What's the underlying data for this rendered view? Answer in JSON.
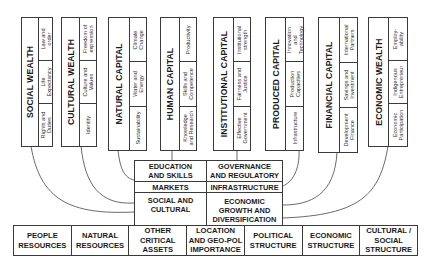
{
  "diagram": {
    "type": "capital-wealth-framework",
    "cards": [
      {
        "id": "social-wealth",
        "title": "SOCIAL WEALTH",
        "items": [
          "Rights and\nDuties",
          "Life\nExpectancy",
          "Law and\norder"
        ]
      },
      {
        "id": "cultural-wealth",
        "title": "CULTURAL WEALTH",
        "items": [
          "Identity",
          "Culture and\nValues",
          "Freedom of\nexpression"
        ]
      },
      {
        "id": "natural-capital",
        "title": "NATURAL CAPITAL",
        "items": [
          "Sustainability",
          "Water and\nEnergy",
          "Climate\nChange"
        ]
      },
      {
        "id": "human-capital",
        "title": "HUMAN CAPITAL",
        "items": [
          "Knowledge\nand Research",
          "Skills and\nCompetence",
          "Productivity"
        ]
      },
      {
        "id": "institutional-capital",
        "title": "INSTITUTIONAL CAPITAL",
        "items": [
          "Effective\nGovernment",
          "Fairness and\nJustice",
          "Institutional\nstrength"
        ]
      },
      {
        "id": "produced-capital",
        "title": "PRODUCED CAPITAL",
        "items": [
          "Infrastructure",
          "Production\nCapacities",
          "Innovation\nand\nTechnology"
        ]
      },
      {
        "id": "financial-capital",
        "title": "FINANCIAL CAPITAL",
        "items": [
          "Development\nFinance",
          "Savings and\nInvestment",
          "International\nPartners"
        ]
      },
      {
        "id": "economic-wealth",
        "title": "ECONOMIC WEALTH",
        "items": [
          "Economic\nParticipation",
          "Indigenous\nEntrepreneur",
          "Employ-\nability"
        ]
      }
    ],
    "center": {
      "education_skills": "EDUCATION\nAND SKILLS",
      "governance_regulatory": "GOVERNANCE\nAND REGULATORY",
      "markets": "MARKETS",
      "infrastructure": "INFRASTRUCTURE",
      "social_cultural": "SOCIAL AND\nCULTURAL",
      "economic_growth": "ECONOMIC\nGROWTH AND\nDIVERSIFICATION"
    },
    "foundation": [
      "PEOPLE\nRESOURCES",
      "NATURAL\nRESOURCES",
      "OTHER\nCRITICAL\nASSETS",
      "LOCATION\nAND GEO-POL\nIMPORTANCE",
      "POLITICAL\nSTRUCTURE",
      "ECONOMIC\nSTRUCTURE",
      "CULTURAL /\nSOCIAL\nSTRUCTURE"
    ],
    "colors": {
      "line": "#3a3a3a",
      "text": "#1a1a1a",
      "background": "#ffffff"
    }
  }
}
